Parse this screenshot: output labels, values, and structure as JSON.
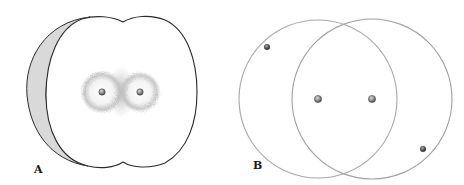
{
  "figure": {
    "panels": [
      {
        "label": "A",
        "description": "Apple-shaped electron cloud (bonding orbital) with two nuclei",
        "outline_color": "#2a2a2a",
        "crescent_color": "#d8d8d8",
        "cloud_color": "#9a9a9a",
        "nuclei": [
          {
            "x": 102,
            "y": 92
          },
          {
            "x": 140,
            "y": 92
          }
        ]
      },
      {
        "label": "B",
        "description": "Two overlapping circular orbits with nuclei and electrons",
        "orbit_color": "#a0a0a0",
        "nuclei": [
          {
            "x": 318,
            "y": 99
          },
          {
            "x": 372,
            "y": 99
          }
        ],
        "electrons": [
          {
            "x": 267,
            "y": 47
          },
          {
            "x": 423,
            "y": 149
          }
        ]
      }
    ],
    "colors": {
      "nucleus": "#8a8a8a",
      "electron": "#555555",
      "background": "#ffffff"
    }
  }
}
